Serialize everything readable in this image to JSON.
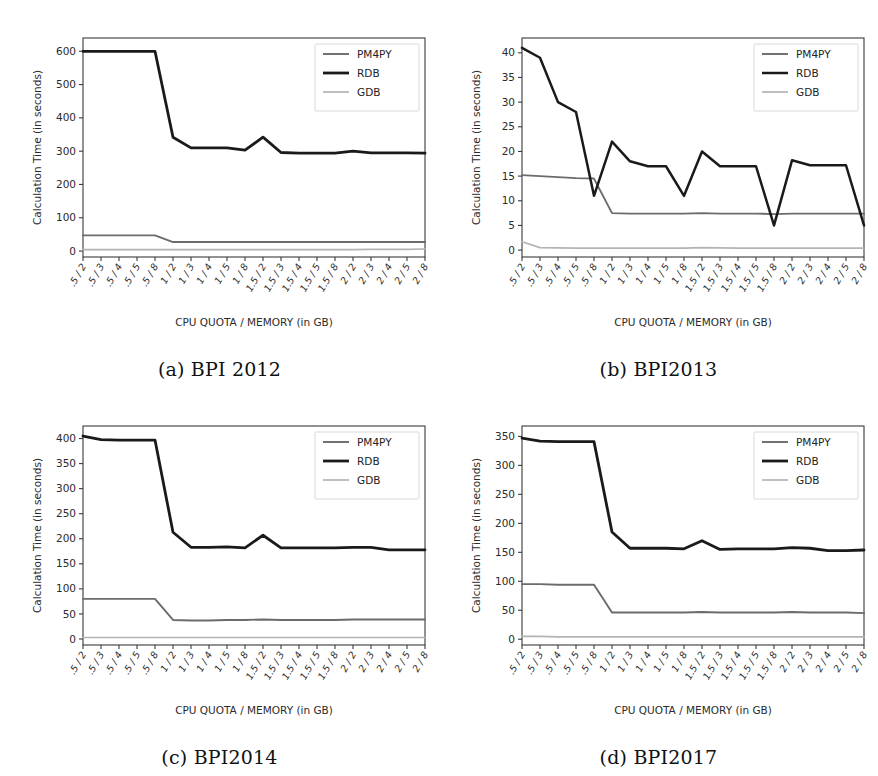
{
  "figure": {
    "panel_count": 4,
    "shared": {
      "xlabel": "CPU QUOTA / MEMORY (in GB)",
      "ylabel": "Calculation Time (in seconds)",
      "categories": [
        ".5 / 2",
        ".5 / 3",
        ".5 / 4",
        ".5 / 5",
        ".5 / 8",
        "1 / 2",
        "1 / 3",
        "1 / 4",
        "1 / 5",
        "1 / 8",
        "1.5 / 2",
        "1.5 / 3",
        "1.5 / 4",
        "1.5 / 5",
        "1.5 / 8",
        "2 / 2",
        "2 / 3",
        "2 / 4",
        "2 / 5",
        "2 / 8"
      ],
      "legend_entries": [
        "PM4PY",
        "RDB",
        "GDB"
      ],
      "colors": {
        "PM4PY": "#6b6b6b",
        "RDB": "#1a1a1a",
        "GDB": "#b4b4b4",
        "axis": "#3a3a3a",
        "background": "#ffffff"
      }
    },
    "captions": {
      "a": "(a) BPI 2012",
      "b": "(b) BPI2013",
      "c": "(c) BPI2014",
      "d": "(d) BPI2017"
    }
  },
  "chart_data": [
    {
      "id": "bpi2012",
      "type": "line",
      "title": "(a) BPI 2012",
      "xlabel": "CPU QUOTA / MEMORY (in GB)",
      "ylabel": "Calculation Time (in seconds)",
      "categories": [
        ".5 / 2",
        ".5 / 3",
        ".5 / 4",
        ".5 / 5",
        ".5 / 8",
        "1 / 2",
        "1 / 3",
        "1 / 4",
        "1 / 5",
        "1 / 8",
        "1.5 / 2",
        "1.5 / 3",
        "1.5 / 4",
        "1.5 / 5",
        "1.5 / 8",
        "2 / 2",
        "2 / 3",
        "2 / 4",
        "2 / 5",
        "2 / 8"
      ],
      "yticks": [
        0,
        100,
        200,
        300,
        400,
        500,
        600
      ],
      "ylim": [
        -18,
        640
      ],
      "grid": false,
      "legend_position": "upper right",
      "series": [
        {
          "name": "PM4PY",
          "color": "#6b6b6b",
          "width": 1.9,
          "values": [
            47,
            47,
            47,
            47,
            47,
            27,
            27,
            27,
            27,
            27,
            27,
            27,
            27,
            27,
            27,
            27,
            27,
            27,
            27,
            27
          ]
        },
        {
          "name": "RDB",
          "color": "#1a1a1a",
          "width": 2.8,
          "values": [
            600,
            600,
            600,
            600,
            600,
            342,
            310,
            310,
            310,
            303,
            342,
            296,
            294,
            294,
            294,
            300,
            295,
            295,
            295,
            294
          ]
        },
        {
          "name": "GDB",
          "color": "#b4b4b4",
          "width": 1.7,
          "values": [
            4,
            4,
            4,
            4,
            4,
            4,
            4,
            4,
            4,
            4,
            4,
            4,
            4,
            4,
            4,
            4,
            5,
            5,
            5,
            6
          ]
        }
      ]
    },
    {
      "id": "bpi2013",
      "type": "line",
      "title": "(b) BPI2013",
      "xlabel": "CPU QUOTA / MEMORY (in GB)",
      "ylabel": "Calculation Time (in seconds)",
      "categories": [
        ".5 / 2",
        ".5 / 3",
        ".5 / 4",
        ".5 / 5",
        ".5 / 8",
        "1 / 2",
        "1 / 3",
        "1 / 4",
        "1 / 5",
        "1 / 8",
        "1.5 / 2",
        "1.5 / 3",
        "1.5 / 4",
        "1.5 / 5",
        "1.5 / 8",
        "2 / 2",
        "2 / 3",
        "2 / 4",
        "2 / 5",
        "2 / 8"
      ],
      "yticks": [
        0,
        5,
        10,
        15,
        20,
        25,
        30,
        35,
        40
      ],
      "ylim": [
        -1.4,
        43
      ],
      "grid": false,
      "legend_position": "upper right",
      "series": [
        {
          "name": "PM4PY",
          "color": "#6b6b6b",
          "width": 1.9,
          "values": [
            15.2,
            15.0,
            14.8,
            14.6,
            14.5,
            7.5,
            7.4,
            7.4,
            7.4,
            7.4,
            7.5,
            7.4,
            7.4,
            7.4,
            7.3,
            7.4,
            7.4,
            7.4,
            7.4,
            7.4
          ]
        },
        {
          "name": "RDB",
          "color": "#1a1a1a",
          "width": 2.5,
          "values": [
            41,
            39,
            30,
            28,
            11,
            22,
            18,
            17,
            17,
            11,
            20,
            17,
            17,
            17,
            5,
            18.2,
            17.2,
            17.2,
            17.2,
            5
          ]
        },
        {
          "name": "GDB",
          "color": "#b4b4b4",
          "width": 1.7,
          "values": [
            1.7,
            0.5,
            0.45,
            0.4,
            0.4,
            0.4,
            0.4,
            0.4,
            0.4,
            0.4,
            0.5,
            0.45,
            0.4,
            0.4,
            0.4,
            0.4,
            0.4,
            0.4,
            0.4,
            0.4
          ]
        }
      ]
    },
    {
      "id": "bpi2014",
      "type": "line",
      "title": "(c) BPI2014",
      "xlabel": "CPU QUOTA / MEMORY (in GB)",
      "ylabel": "Calculation Time (in seconds)",
      "categories": [
        ".5 / 2",
        ".5 / 3",
        ".5 / 4",
        ".5 / 5",
        ".5 / 8",
        "1 / 2",
        "1 / 3",
        "1 / 4",
        "1 / 5",
        "1 / 8",
        "1.5 / 2",
        "1.5 / 3",
        "1.5 / 4",
        "1.5 / 5",
        "1.5 / 8",
        "2 / 2",
        "2 / 3",
        "2 / 4",
        "2 / 5",
        "2 / 8"
      ],
      "yticks": [
        0,
        50,
        100,
        150,
        200,
        250,
        300,
        350,
        400
      ],
      "ylim": [
        -12,
        425
      ],
      "grid": false,
      "legend_position": "upper right",
      "series": [
        {
          "name": "PM4PY",
          "color": "#6b6b6b",
          "width": 1.9,
          "values": [
            80,
            80,
            80,
            80,
            80,
            38,
            37,
            37,
            38,
            38,
            39,
            38,
            38,
            38,
            38,
            39,
            39,
            39,
            39,
            39
          ]
        },
        {
          "name": "RDB",
          "color": "#1a1a1a",
          "width": 2.8,
          "values": [
            405,
            398,
            397,
            397,
            397,
            213,
            183,
            183,
            184,
            182,
            207,
            182,
            182,
            182,
            182,
            183,
            183,
            178,
            178,
            178
          ]
        },
        {
          "name": "GDB",
          "color": "#b4b4b4",
          "width": 1.7,
          "values": [
            3,
            3,
            3,
            3,
            3,
            3,
            3,
            3,
            3,
            3,
            3,
            3,
            3,
            3,
            3,
            3,
            3,
            3,
            3,
            3
          ]
        }
      ]
    },
    {
      "id": "bpi2017",
      "type": "line",
      "title": "(d) BPI2017",
      "xlabel": "CPU QUOTA / MEMORY (in GB)",
      "ylabel": "Calculation Time (in seconds)",
      "categories": [
        ".5 / 2",
        ".5 / 3",
        ".5 / 4",
        ".5 / 5",
        ".5 / 8",
        "1 / 2",
        "1 / 3",
        "1 / 4",
        "1 / 5",
        "1 / 8",
        "1.5 / 2",
        "1.5 / 3",
        "1.5 / 4",
        "1.5 / 5",
        "1.5 / 8",
        "2 / 2",
        "2 / 3",
        "2 / 4",
        "2 / 5",
        "2 / 8"
      ],
      "yticks": [
        0,
        50,
        100,
        150,
        200,
        250,
        300,
        350
      ],
      "ylim": [
        -10,
        368
      ],
      "grid": false,
      "legend_position": "upper right",
      "series": [
        {
          "name": "PM4PY",
          "color": "#6b6b6b",
          "width": 1.9,
          "values": [
            95,
            95,
            94,
            94,
            94,
            46,
            46,
            46,
            46,
            46,
            47,
            46,
            46,
            46,
            46,
            47,
            46,
            46,
            46,
            45
          ]
        },
        {
          "name": "RDB",
          "color": "#1a1a1a",
          "width": 2.8,
          "values": [
            347,
            342,
            341,
            341,
            341,
            185,
            157,
            157,
            157,
            156,
            170,
            155,
            156,
            156,
            156,
            158,
            157,
            153,
            153,
            154
          ]
        },
        {
          "name": "GDB",
          "color": "#b4b4b4",
          "width": 1.7,
          "values": [
            5,
            5,
            4,
            4,
            4,
            4,
            4,
            4,
            4,
            4,
            4,
            4,
            4,
            4,
            4,
            4,
            4,
            4,
            4,
            4
          ]
        }
      ]
    }
  ]
}
